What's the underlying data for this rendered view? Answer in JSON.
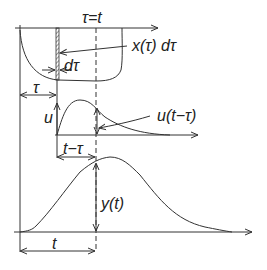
{
  "labels": {
    "tau_eq_t": "τ=t",
    "x_tau_dtau": "x(τ) dτ",
    "dtau": "dτ",
    "tau": "τ",
    "u": "u",
    "u_t_minus_tau": "u(t−τ)",
    "t_minus_tau": "t−τ",
    "y_t": "y(t)",
    "t": "t"
  },
  "colors": {
    "line": "#333333",
    "background": "#ffffff"
  }
}
